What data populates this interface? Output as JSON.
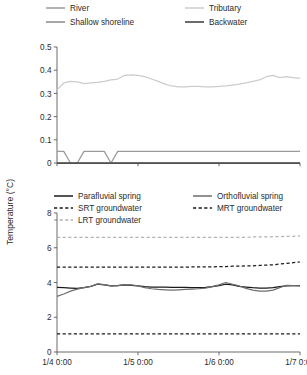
{
  "figure": {
    "y_axis_title": "Temperature (°C)"
  },
  "chart_data": [
    {
      "type": "line",
      "id": "top-panel",
      "title": "",
      "xlabel": "",
      "ylabel": "Temperature (°C)",
      "xlim": [
        0,
        72
      ],
      "ylim": [
        0,
        0.5
      ],
      "grid": false,
      "legend_position": "top",
      "x_tick_labels": [
        "1/4 0:00",
        "1/5 0:00",
        "1/6 0:00",
        "1/7 0:00"
      ],
      "x_tick_values": [
        0,
        24,
        48,
        72
      ],
      "y_tick_labels": [
        "0",
        "0.1",
        "0.2",
        "0.3",
        "0.4",
        "0.5"
      ],
      "y_tick_values": [
        0,
        0.1,
        0.2,
        0.3,
        0.4,
        0.5
      ],
      "x": [
        0,
        2,
        4,
        6,
        8,
        10,
        12,
        14,
        16,
        18,
        20,
        22,
        24,
        26,
        28,
        30,
        32,
        34,
        36,
        38,
        40,
        42,
        44,
        46,
        48,
        50,
        52,
        54,
        56,
        58,
        60,
        62,
        64,
        66,
        68,
        70,
        72
      ],
      "series": [
        {
          "name": "River",
          "color": "#9a9a9a",
          "style": "solid",
          "values": [
            0.05,
            0.05,
            0.0,
            0.0,
            0.05,
            0.05,
            0.05,
            0.05,
            0.0,
            0.05,
            0.05,
            0.05,
            0.05,
            0.05,
            0.05,
            0.05,
            0.05,
            0.05,
            0.05,
            0.05,
            0.05,
            0.05,
            0.05,
            0.05,
            0.05,
            0.05,
            0.05,
            0.05,
            0.05,
            0.05,
            0.05,
            0.05,
            0.05,
            0.05,
            0.05,
            0.05,
            0.05
          ]
        },
        {
          "name": "Tributary",
          "color": "#cccccc",
          "style": "solid",
          "values": [
            0.315,
            0.345,
            0.352,
            0.35,
            0.342,
            0.345,
            0.348,
            0.352,
            0.358,
            0.362,
            0.378,
            0.38,
            0.378,
            0.372,
            0.362,
            0.352,
            0.34,
            0.332,
            0.328,
            0.328,
            0.33,
            0.33,
            0.328,
            0.328,
            0.33,
            0.332,
            0.336,
            0.34,
            0.345,
            0.352,
            0.358,
            0.372,
            0.378,
            0.368,
            0.372,
            0.368,
            0.365
          ]
        },
        {
          "name": "Shallow shoreline",
          "color": "#8a8a8a",
          "style": "solid",
          "values": [
            0.0,
            0.0,
            0.0,
            0.0,
            0.0,
            0.0,
            0.0,
            0.0,
            0.0,
            0.0,
            0.0,
            0.0,
            0.0,
            0.0,
            0.0,
            0.0,
            0.0,
            0.0,
            0.0,
            0.0,
            0.0,
            0.0,
            0.0,
            0.0,
            0.0,
            0.0,
            0.0,
            0.0,
            0.0,
            0.0,
            0.0,
            0.0,
            0.0,
            0.0,
            0.0,
            0.0,
            0.0
          ]
        },
        {
          "name": "Backwater",
          "color": "#3a3a3a",
          "style": "solid",
          "values": [
            0.0,
            0.0,
            0.0,
            0.0,
            0.0,
            0.0,
            0.0,
            0.0,
            0.0,
            0.0,
            0.0,
            0.0,
            0.0,
            0.0,
            0.0,
            0.0,
            0.0,
            0.0,
            0.0,
            0.0,
            0.0,
            0.0,
            0.0,
            0.0,
            0.0,
            0.0,
            0.0,
            0.0,
            0.0,
            0.0,
            0.0,
            0.0,
            0.0,
            0.0,
            0.0,
            0.0,
            0.0
          ]
        }
      ],
      "legend": [
        {
          "label": "River",
          "color": "#9a9a9a",
          "style": "solid"
        },
        {
          "label": "Tributary",
          "color": "#cccccc",
          "style": "solid"
        },
        {
          "label": "Shallow shoreline",
          "color": "#8a8a8a",
          "style": "solid"
        },
        {
          "label": "Backwater",
          "color": "#3a3a3a",
          "style": "solid"
        }
      ]
    },
    {
      "type": "line",
      "id": "bottom-panel",
      "title": "",
      "xlabel": "",
      "ylabel": "Temperature (°C)",
      "xlim": [
        0,
        72
      ],
      "ylim": [
        0,
        8
      ],
      "grid": false,
      "legend_position": "top",
      "x_tick_labels": [
        "1/4 0:00",
        "1/5 0:00",
        "1/6 0:00",
        "1/7 0:00"
      ],
      "x_tick_values": [
        0,
        24,
        48,
        72
      ],
      "y_tick_labels": [
        "0",
        "2",
        "4",
        "6",
        "8"
      ],
      "y_tick_values": [
        0,
        2,
        4,
        6,
        8
      ],
      "x": [
        0,
        2,
        4,
        6,
        8,
        10,
        12,
        14,
        16,
        18,
        20,
        22,
        24,
        26,
        28,
        30,
        32,
        34,
        36,
        38,
        40,
        42,
        44,
        46,
        48,
        50,
        52,
        54,
        56,
        58,
        60,
        62,
        64,
        66,
        68,
        70,
        72
      ],
      "series": [
        {
          "name": "Parafluvial spring",
          "color": "#1a1a1a",
          "style": "solid",
          "values": [
            3.72,
            3.7,
            3.68,
            3.66,
            3.7,
            3.78,
            3.9,
            3.86,
            3.8,
            3.82,
            3.86,
            3.84,
            3.8,
            3.76,
            3.74,
            3.74,
            3.74,
            3.72,
            3.72,
            3.72,
            3.7,
            3.7,
            3.72,
            3.76,
            3.82,
            3.9,
            3.86,
            3.78,
            3.74,
            3.7,
            3.68,
            3.68,
            3.7,
            3.76,
            3.8,
            3.82,
            3.82
          ]
        },
        {
          "name": "Orthofluvial spring",
          "color": "#6e6e6e",
          "style": "solid",
          "values": [
            3.2,
            3.34,
            3.5,
            3.62,
            3.7,
            3.78,
            3.92,
            3.88,
            3.8,
            3.82,
            3.88,
            3.86,
            3.8,
            3.7,
            3.64,
            3.6,
            3.58,
            3.56,
            3.58,
            3.6,
            3.62,
            3.64,
            3.68,
            3.76,
            3.86,
            4.0,
            3.9,
            3.8,
            3.66,
            3.56,
            3.5,
            3.5,
            3.56,
            3.7,
            3.84,
            3.82,
            3.8
          ]
        },
        {
          "name": "SRT groundwater",
          "color": "#1a1a1a",
          "style": "dashed",
          "values": [
            4.88,
            4.88,
            4.88,
            4.88,
            4.88,
            4.88,
            4.88,
            4.88,
            4.88,
            4.88,
            4.88,
            4.88,
            4.88,
            4.88,
            4.88,
            4.88,
            4.88,
            4.88,
            4.88,
            4.88,
            4.9,
            4.9,
            4.9,
            4.9,
            4.92,
            4.92,
            4.94,
            4.94,
            4.96,
            4.96,
            4.98,
            5.0,
            5.02,
            5.06,
            5.1,
            5.14,
            5.18
          ]
        },
        {
          "name": "MRT groundwater",
          "color": "#1a1a1a",
          "style": "dashed",
          "values": [
            1.05,
            1.05,
            1.05,
            1.05,
            1.05,
            1.05,
            1.05,
            1.05,
            1.05,
            1.05,
            1.05,
            1.05,
            1.05,
            1.05,
            1.05,
            1.05,
            1.05,
            1.05,
            1.05,
            1.05,
            1.05,
            1.05,
            1.05,
            1.05,
            1.05,
            1.05,
            1.05,
            1.05,
            1.05,
            1.05,
            1.05,
            1.05,
            1.05,
            1.05,
            1.05,
            1.05,
            1.05
          ]
        },
        {
          "name": "LRT groundwater",
          "color": "#b4b4b4",
          "style": "dashed",
          "values": [
            6.6,
            6.6,
            6.6,
            6.6,
            6.6,
            6.6,
            6.6,
            6.6,
            6.6,
            6.6,
            6.6,
            6.6,
            6.6,
            6.6,
            6.6,
            6.6,
            6.6,
            6.6,
            6.6,
            6.6,
            6.6,
            6.6,
            6.6,
            6.6,
            6.6,
            6.6,
            6.6,
            6.6,
            6.6,
            6.62,
            6.62,
            6.62,
            6.64,
            6.64,
            6.66,
            6.66,
            6.68
          ]
        }
      ],
      "legend": [
        {
          "label": "Parafluvial spring",
          "color": "#1a1a1a",
          "style": "solid"
        },
        {
          "label": "Orthofluvial spring",
          "color": "#6e6e6e",
          "style": "solid"
        },
        {
          "label": "SRT groundwater",
          "color": "#1a1a1a",
          "style": "dashed"
        },
        {
          "label": "MRT groundwater",
          "color": "#1a1a1a",
          "style": "dashed"
        },
        {
          "label": "LRT groundwater",
          "color": "#b4b4b4",
          "style": "dashed"
        }
      ]
    }
  ]
}
